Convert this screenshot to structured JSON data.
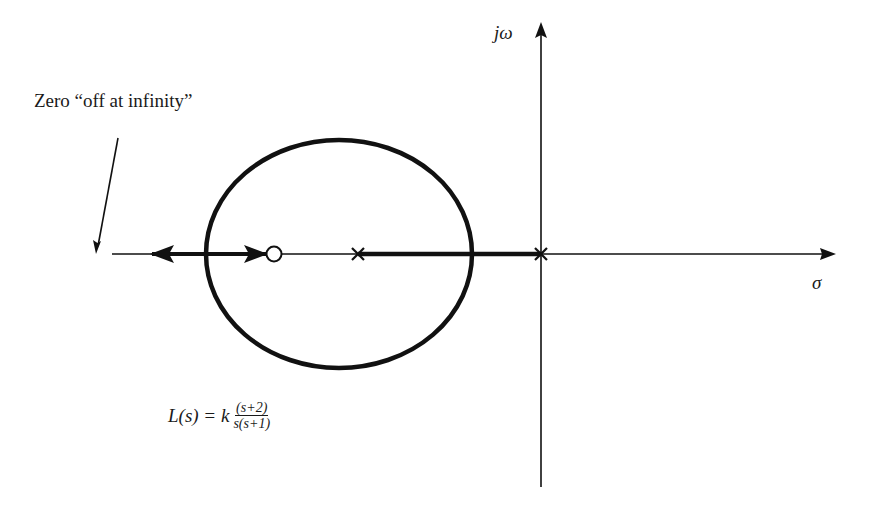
{
  "diagram": {
    "type": "root-locus",
    "axes": {
      "real_axis_label": "σ",
      "imag_axis_label": "jω"
    },
    "annotation": {
      "text": "Zero “off at infinity”"
    },
    "transfer_function": {
      "lhs": "L(s) = k",
      "numerator": "(s+2)",
      "denominator": "s(s+1)"
    },
    "poles": [
      {
        "label": "pole at s=0",
        "marker": "x"
      },
      {
        "label": "pole at s=-1",
        "marker": "x"
      }
    ],
    "zeros": [
      {
        "label": "zero at s=-2",
        "marker": "o"
      },
      {
        "label": "zero at infinity",
        "marker": "none"
      }
    ],
    "colors": {
      "stroke": "#111111",
      "background": "#ffffff"
    }
  }
}
